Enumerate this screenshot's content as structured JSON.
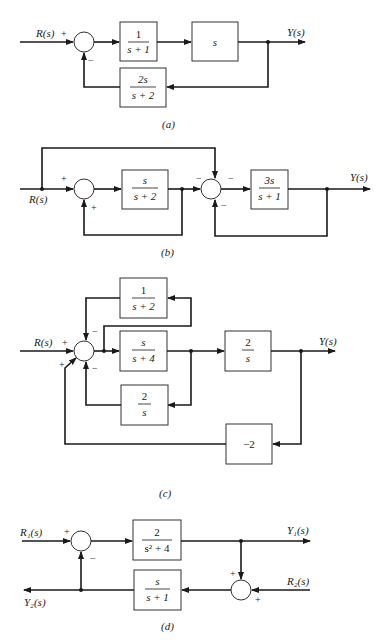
{
  "diagrams": [
    {
      "id": "a",
      "caption": "(a)",
      "input": "R(s)",
      "output": "Y(s)",
      "summing_signs": {
        "input": "+",
        "feedback": "−"
      },
      "blocks": [
        {
          "num": "1",
          "den": "s + 1"
        },
        {
          "num": "s",
          "den": ""
        },
        {
          "num": "2s",
          "den": "s + 2",
          "role": "feedback"
        }
      ]
    },
    {
      "id": "b",
      "caption": "(b)",
      "input": "R(s)",
      "output": "Y(s)",
      "summing1_signs": {
        "input": "+",
        "feedback": "+"
      },
      "summing2_signs": {
        "top": "−",
        "left": "−",
        "bottom": "−"
      },
      "blocks": [
        {
          "num": "s",
          "den": "s + 2"
        },
        {
          "num": "3s",
          "den": "s + 1"
        }
      ]
    },
    {
      "id": "c",
      "caption": "(c)",
      "input": "R(s)",
      "output": "Y(s)",
      "summing_signs": {
        "input": "+",
        "top": "−",
        "lower_left": "+",
        "bottom": "−"
      },
      "blocks": [
        {
          "num": "1",
          "den": "s + 2",
          "role": "feedback-top"
        },
        {
          "num": "s",
          "den": "s + 4"
        },
        {
          "num": "2",
          "den": "s"
        },
        {
          "num": "2",
          "den": "s",
          "role": "feedback-bottom"
        },
        {
          "num": "−2",
          "den": "",
          "role": "outer-feedback"
        }
      ]
    },
    {
      "id": "d",
      "caption": "(d)",
      "input1": "R₁(s)",
      "input2": "R₂(s)",
      "output1": "Y₁(s)",
      "output2": "Y₂(s)",
      "summing1_signs": {
        "input": "+",
        "feedback": "−"
      },
      "summing2_signs": {
        "top": "+",
        "right": "+"
      },
      "blocks": [
        {
          "num": "2",
          "den": "s² + 4"
        },
        {
          "num": "s",
          "den": "s + 1"
        }
      ]
    }
  ]
}
